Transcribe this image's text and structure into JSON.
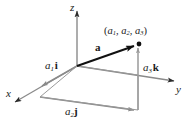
{
  "figure": {
    "colors": {
      "axis": "#8a8a8a",
      "helper": "#9a9a9a",
      "vector": "#111111",
      "text": "#1a1a1a",
      "background": "#ffffff"
    },
    "axes": [
      {
        "id": "x",
        "label": "x"
      },
      {
        "id": "y",
        "label": "y"
      },
      {
        "id": "z",
        "label": "z"
      }
    ],
    "point": {
      "open_paren": "(",
      "close_paren": ")",
      "coord1_base": "a",
      "coord1_sub": "1",
      "sep1": ", ",
      "coord2_base": "a",
      "coord2_sub": "2",
      "sep2": ", ",
      "coord3_base": "a",
      "coord3_sub": "3",
      "full_label": "(a1, a2, a3)"
    },
    "vector": {
      "label": "a"
    },
    "components": [
      {
        "id": "x-component",
        "scalar_base": "a",
        "scalar_sub": "1",
        "unit": "i",
        "full_label": "a1 i"
      },
      {
        "id": "y-component",
        "scalar_base": "a",
        "scalar_sub": "2",
        "unit": "j",
        "full_label": "a2 j"
      },
      {
        "id": "z-component",
        "scalar_base": "a",
        "scalar_sub": "3",
        "unit": "k",
        "full_label": "a3 k"
      }
    ]
  }
}
